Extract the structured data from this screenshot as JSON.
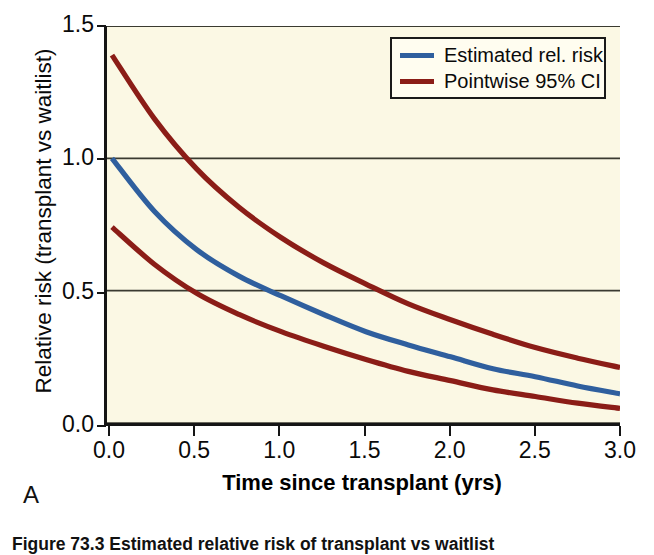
{
  "figure": {
    "panel_letter": "A",
    "caption": "Figure 73.3   Estimated relative risk of transplant vs waitlist",
    "background_color": "#fbf8e4",
    "axis_color": "#151515"
  },
  "legend": {
    "position": "top-right",
    "entries": [
      {
        "label": "Estimated rel. risk",
        "color": "#2f5f9e"
      },
      {
        "label": "Pointwise 95% CI",
        "color": "#8b1d17"
      }
    ]
  },
  "chart_data": {
    "type": "line",
    "title": "",
    "subtitle": "",
    "xlabel": "Time since transplant (yrs)",
    "ylabel": "Relative risk (transplant vs waitlist)",
    "xlim": [
      0.0,
      3.0
    ],
    "ylim": [
      0.0,
      1.5
    ],
    "xticks": [
      0.0,
      0.5,
      1.0,
      1.5,
      2.0,
      2.5,
      3.0
    ],
    "xtick_labels": [
      "0.0",
      "0.5",
      "1.0",
      "1.5",
      "2.0",
      "2.5",
      "3.0"
    ],
    "yticks": [
      0.0,
      0.5,
      1.0,
      1.5
    ],
    "ytick_labels": [
      "0.0",
      "0.5",
      "1.0",
      "1.5"
    ],
    "grid": "horizontal",
    "x": [
      0.0,
      0.25,
      0.5,
      0.75,
      1.0,
      1.25,
      1.5,
      1.75,
      2.0,
      2.25,
      2.5,
      2.75,
      3.0
    ],
    "series": [
      {
        "name": "Estimated rel. risk",
        "color": "#2f5f9e",
        "values": [
          1.0,
          0.8,
          0.655,
          0.555,
          0.48,
          0.41,
          0.345,
          0.295,
          0.25,
          0.205,
          0.175,
          0.14,
          0.11
        ]
      },
      {
        "name": "Pointwise 95% CI upper",
        "color": "#8b1d17",
        "values": [
          1.39,
          1.15,
          0.96,
          0.815,
          0.7,
          0.605,
          0.525,
          0.45,
          0.39,
          0.335,
          0.285,
          0.245,
          0.21
        ]
      },
      {
        "name": "Pointwise 95% CI lower",
        "color": "#8b1d17",
        "values": [
          0.74,
          0.6,
          0.49,
          0.41,
          0.345,
          0.29,
          0.24,
          0.195,
          0.16,
          0.125,
          0.1,
          0.075,
          0.055
        ]
      }
    ],
    "annotations": []
  }
}
